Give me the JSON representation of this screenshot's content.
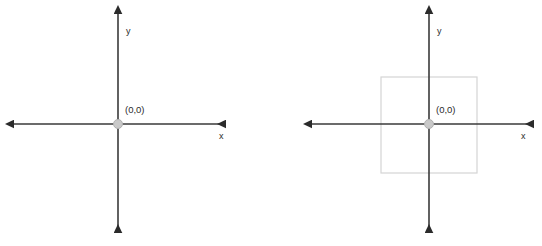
{
  "figure": {
    "type": "diagram",
    "background_color": "#ffffff",
    "panel_count": 2
  },
  "style": {
    "axis_color": "#3a3a3a",
    "axis_width": 1.6,
    "arrow_color": "#2b2b2b",
    "origin_dot_fill": "#c9c9c9",
    "origin_dot_stroke": "#b0b0b0",
    "square_stroke": "#d4d4d4",
    "square_fill": "none",
    "text_color": "#2b2b2b"
  },
  "panels": [
    {
      "id": "left-plane",
      "name": "plain-coordinate-plane",
      "origin": {
        "x": 118,
        "y": 124,
        "label": "(0,0)",
        "radius": 4.5
      },
      "x_axis": {
        "label": "x",
        "label_x": 219,
        "label_y": 139,
        "start_x": 13,
        "end_x": 225,
        "y": 124,
        "arrow_left": true,
        "arrow_right": true
      },
      "y_axis": {
        "label": "y",
        "label_x": 126,
        "label_y": 34,
        "x": 118,
        "start_y": 13,
        "end_y": 232,
        "arrow_up": true,
        "arrow_down": true
      },
      "shapes": []
    },
    {
      "id": "right-plane",
      "name": "coordinate-plane-with-square",
      "origin": {
        "x": 158,
        "y": 124,
        "label": "(0,0)",
        "radius": 4.5
      },
      "x_axis": {
        "label": "x",
        "label_x": 250,
        "label_y": 139,
        "start_x": 40,
        "end_x": 262,
        "y": 124,
        "arrow_left": true,
        "arrow_right": true
      },
      "y_axis": {
        "label": "y",
        "label_x": 166,
        "label_y": 34,
        "x": 158,
        "start_y": 13,
        "end_y": 232,
        "arrow_up": true,
        "arrow_down": true
      },
      "shapes": [
        {
          "type": "square",
          "name": "centered-square",
          "x": 110,
          "y": 77,
          "width": 96,
          "height": 96,
          "stroke_width": 1.2,
          "centered_on_origin": true
        }
      ]
    }
  ]
}
